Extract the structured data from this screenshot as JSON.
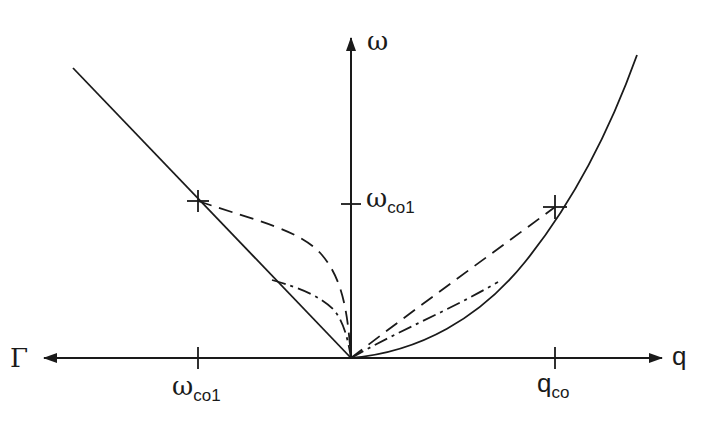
{
  "figure": {
    "type": "dispersion-diagram",
    "axes": {
      "horizontal_right_label": "q",
      "horizontal_left_label": "Γ",
      "vertical_label": "ω"
    },
    "ticks": {
      "vertical": {
        "symbol": "ω",
        "subscript": "co1"
      },
      "left_horizontal": {
        "symbol": "ω",
        "subscript": "co1"
      },
      "right_horizontal": {
        "symbol": "q",
        "subscript": "co"
      }
    },
    "curves": [
      {
        "name": "left-linear-solid",
        "style": "solid",
        "side": "left"
      },
      {
        "name": "left-dashed",
        "style": "dashed",
        "side": "left"
      },
      {
        "name": "left-dash-dot",
        "style": "dash-dot",
        "side": "left"
      },
      {
        "name": "right-parabola-solid",
        "style": "solid",
        "side": "right"
      },
      {
        "name": "right-dashed",
        "style": "dashed",
        "side": "right"
      },
      {
        "name": "right-dash-dot",
        "style": "dash-dot",
        "side": "right"
      }
    ],
    "markers": [
      {
        "name": "left-crossover",
        "symbol": "+"
      },
      {
        "name": "right-crossover",
        "symbol": "+"
      }
    ],
    "colors": {
      "ink": "#1a1a1a",
      "background": "#ffffff"
    }
  }
}
